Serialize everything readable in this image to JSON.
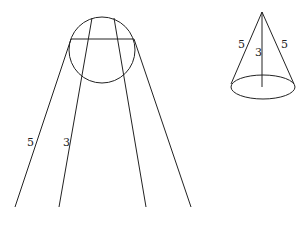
{
  "diagram": {
    "stroke_color": "#222222",
    "background": "#ffffff",
    "unfolded_cone": {
      "labels": {
        "slant": "5",
        "height": "3"
      }
    },
    "cone": {
      "labels": {
        "left_slant": "5",
        "height": "3",
        "right_slant": "5"
      }
    }
  }
}
